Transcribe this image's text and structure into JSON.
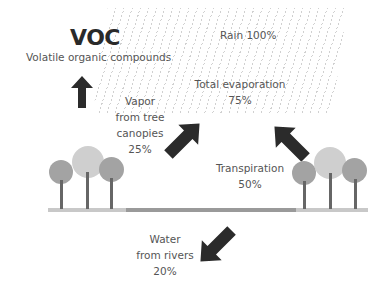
{
  "title": "VOC",
  "subtitle": "Volatile organic compounds",
  "labels": {
    "rain": "Rain 100%",
    "total_evaporation": [
      "Total evaporation",
      "75%"
    ],
    "vapor": [
      "Vapor",
      "from tree",
      "canopies",
      "25%"
    ],
    "transpiration": [
      "Transpiration",
      "50%"
    ],
    "water": [
      "Water",
      "from rivers",
      "20%"
    ]
  },
  "colors": {
    "arrow": "#2b2b2b",
    "crown_dark": "#a3a3a3",
    "crown_light": "#cfcfcf",
    "trunk": "#666666",
    "ground_dark": "#9a9a9a",
    "ground_light": "#c8c8c8",
    "rain": "#aaaaaa"
  }
}
